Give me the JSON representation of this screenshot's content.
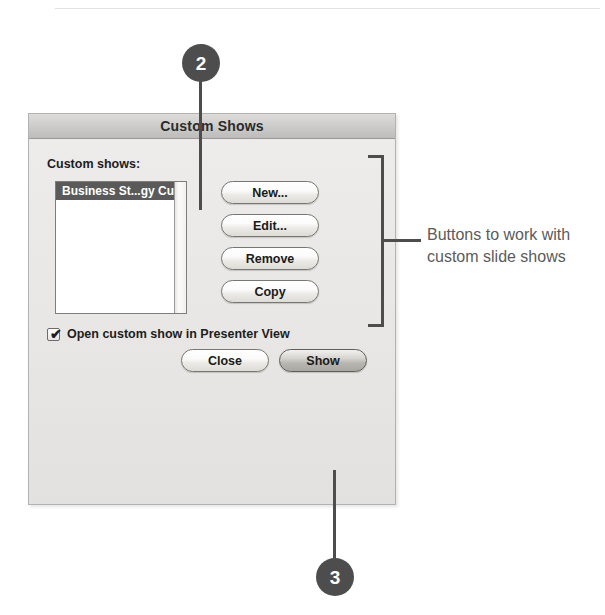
{
  "dialog": {
    "title": "Custom Shows",
    "field_label": "Custom shows:",
    "list": {
      "items": [
        {
          "label": "Business St...gy Custom",
          "selected": true
        }
      ]
    },
    "checkbox": {
      "label": "Open custom show in Presenter View",
      "checked": true,
      "glyph": "✔"
    },
    "side_buttons": [
      {
        "id": "new",
        "label": "New..."
      },
      {
        "id": "edit",
        "label": "Edit..."
      },
      {
        "id": "remove",
        "label": "Remove"
      },
      {
        "id": "copy",
        "label": "Copy"
      }
    ],
    "footer_buttons": [
      {
        "id": "close",
        "label": "Close",
        "default": false
      },
      {
        "id": "show",
        "label": "Show",
        "default": true
      }
    ]
  },
  "annotations": {
    "bracket_text": "Buttons to work with custom slide shows",
    "callouts": [
      {
        "number": "2",
        "target": "custom-shows-list"
      },
      {
        "number": "3",
        "target": "show-button"
      }
    ]
  },
  "colors": {
    "callout_fill": "#4d4d4d",
    "callout_text": "#ffffff",
    "annotation_text": "#5b5b5b",
    "dialog_background": "#e9e8e6",
    "selection_background": "#5a5a5a"
  }
}
